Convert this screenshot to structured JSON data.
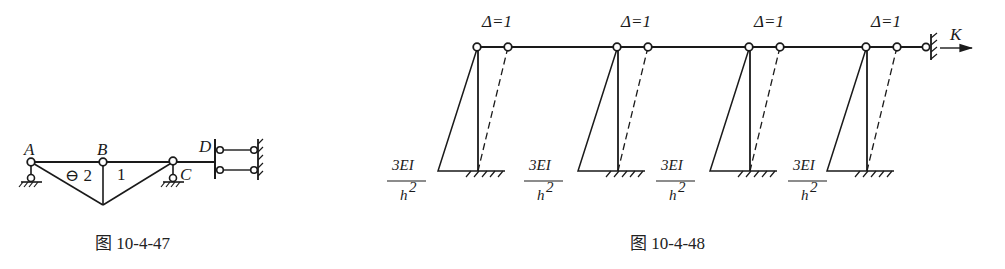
{
  "figure_47": {
    "caption": "图 10-4-47",
    "nodes": [
      {
        "label": "A",
        "x": 31,
        "y": 162
      },
      {
        "label": "B",
        "x": 103,
        "y": 162
      },
      {
        "label": "C",
        "x": 173,
        "y": 161
      },
      {
        "label": "D",
        "x": 215,
        "y": 160
      }
    ],
    "member_labels": [
      {
        "text": "⊖ 2",
        "x": 65,
        "y": 182
      },
      {
        "text": "1",
        "x": 118,
        "y": 181
      }
    ]
  },
  "figure_48": {
    "caption": "图 10-4-48",
    "displacement_label": "Δ=1",
    "stiffness_label": "K",
    "moment_numerator": "3EI",
    "moment_denominator": "h",
    "moment_denominator_exp": "2",
    "columns": [
      {
        "top_x": 477,
        "dashed_x": 508,
        "diagram_left": 438,
        "frac_x": 407
      },
      {
        "top_x": 617,
        "dashed_x": 648,
        "diagram_left": 578,
        "frac_x": 544
      },
      {
        "top_x": 749,
        "dashed_x": 780,
        "diagram_left": 710,
        "frac_x": 676
      },
      {
        "top_x": 866,
        "dashed_x": 897,
        "diagram_left": 827,
        "frac_x": 808
      }
    ]
  },
  "colors": {
    "ink": "#1a1a1a",
    "background": "#ffffff"
  }
}
